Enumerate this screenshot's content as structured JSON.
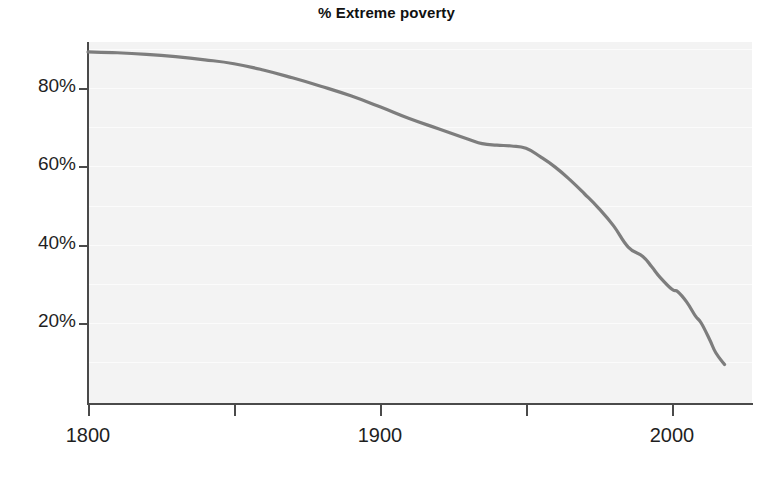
{
  "chart_data": {
    "type": "line",
    "title": "% Extreme poverty",
    "xlabel": "",
    "ylabel": "",
    "xlim": [
      1800,
      2018
    ],
    "ylim": [
      0,
      95
    ],
    "grid": true,
    "legend": "none",
    "y_tick_labels": [
      "80%",
      "60%",
      "40%",
      "20%"
    ],
    "y_tick_values": [
      80,
      60,
      40,
      20
    ],
    "x_tick_labels": [
      "1800",
      "1900",
      "2000"
    ],
    "x_tick_values": [
      1800,
      1900,
      2000
    ],
    "x_minor_ticks": [
      1850,
      1950
    ],
    "gridline_values": [
      90,
      80,
      70,
      60,
      50,
      40,
      30,
      20,
      10
    ],
    "line_color": "#7d7d7d",
    "plot_background": "#f3f3f3",
    "gridline_color": "#fbfbfb",
    "axis_color": "#4a4a4a",
    "series": [
      {
        "name": "% Extreme poverty",
        "x": [
          1800,
          1810,
          1820,
          1830,
          1840,
          1850,
          1860,
          1870,
          1880,
          1890,
          1900,
          1910,
          1920,
          1930,
          1935,
          1940,
          1945,
          1950,
          1955,
          1960,
          1965,
          1970,
          1975,
          1980,
          1985,
          1990,
          1993,
          1996,
          2000,
          2002,
          2005,
          2008,
          2010,
          2013,
          2015,
          2018
        ],
        "values": [
          89.2,
          89.0,
          88.6,
          88.0,
          87.2,
          86.2,
          84.6,
          82.6,
          80.4,
          78.0,
          75.2,
          72.2,
          69.6,
          67.0,
          65.8,
          65.4,
          65.2,
          64.6,
          62.4,
          59.8,
          56.6,
          53.0,
          49.2,
          44.8,
          39.4,
          37.0,
          34.4,
          31.6,
          28.6,
          28.0,
          25.4,
          21.8,
          20.0,
          15.6,
          12.4,
          9.4
        ]
      }
    ]
  }
}
